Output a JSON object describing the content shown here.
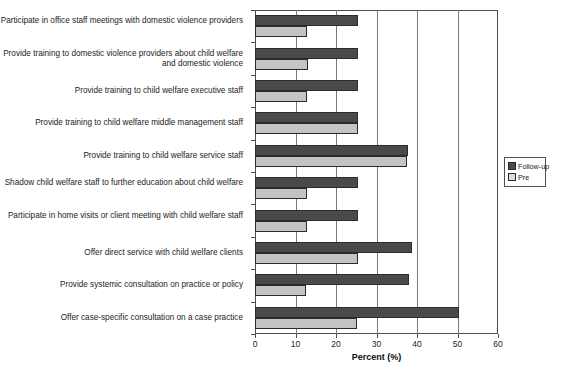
{
  "chart_data": {
    "type": "bar",
    "orientation": "horizontal",
    "title": "",
    "xlabel": "Percent (%)",
    "ylabel": "",
    "xlim": [
      0,
      60
    ],
    "xticks": [
      0,
      10,
      20,
      30,
      40,
      50,
      60
    ],
    "grid": true,
    "legend_position": "right",
    "categories": [
      "Participate in office staff meetings with domestic violence providers",
      "Provide training to domestic violence providers about child welfare and domestic violence",
      "Provide training to child welfare executive staff",
      "Provide training to child welfare middle management staff",
      "Provide training to child welfare service staff",
      "Shadow child welfare staff to further education about child welfare",
      "Participate in home visits or client meeting with child welfare staff",
      "Offer direct service with child welfare clients",
      "Provide systemic consultation on practice or policy",
      "Offer case-specific consultation on a case practice"
    ],
    "series": [
      {
        "name": "Follow-up",
        "color": "#4a4a4a",
        "values": [
          25.4,
          25.4,
          25.4,
          25.4,
          37.8,
          25.4,
          25.4,
          38.8,
          38.0,
          50.4
        ]
      },
      {
        "name": "Pre",
        "color": "#c4c4c4",
        "values": [
          12.8,
          13.0,
          12.8,
          25.4,
          37.5,
          12.8,
          12.8,
          25.4,
          12.6,
          25.2
        ]
      }
    ]
  }
}
